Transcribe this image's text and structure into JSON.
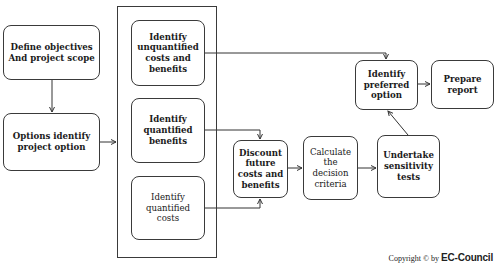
{
  "diagram": {
    "nodes": {
      "define_objectives": "Define objectives And project scope",
      "options_identify": "Options identify project option",
      "unquantified": "Identify unquantified costs and benefits",
      "quantified_benefits": "Identify quantified benefits",
      "quantified_costs": "Identify quantified costs",
      "discount": "Discount future costs and benefits",
      "calculate": "Calculate the decision criteria",
      "sensitivity": "Undertake sensitivity tests",
      "preferred": "Identify preferred option",
      "report": "Prepare report"
    },
    "edges": [
      {
        "from": "define_objectives",
        "to": "options_identify"
      },
      {
        "from": "options_identify",
        "to": "identification_group"
      },
      {
        "from": "unquantified",
        "to": "preferred"
      },
      {
        "from": "quantified_benefits",
        "to": "discount"
      },
      {
        "from": "quantified_costs",
        "to": "discount"
      },
      {
        "from": "discount",
        "to": "calculate"
      },
      {
        "from": "calculate",
        "to": "sensitivity"
      },
      {
        "from": "sensitivity",
        "to": "preferred"
      },
      {
        "from": "preferred",
        "to": "report"
      }
    ]
  },
  "footer": {
    "copyright_prefix": "Copyright © by ",
    "copyright_brand": "EC-Council"
  }
}
